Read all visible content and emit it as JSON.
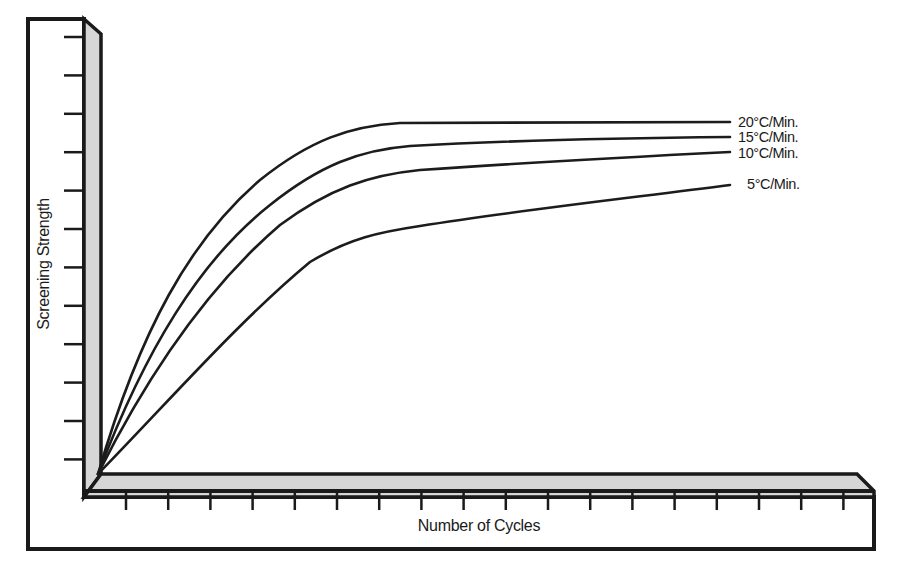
{
  "figure": {
    "ylabel": "Screening Strength",
    "xlabel": "Number of Cycles"
  },
  "legend": {
    "s20": "20°C/Min.",
    "s15": "15°C/Min.",
    "s10": "10°C/Min.",
    "s5": "5°C/Min."
  },
  "axes": {
    "y_tick_count": 12,
    "x_tick_count": 18,
    "y_tick_labels": [],
    "x_tick_labels": []
  },
  "chart_data": {
    "type": "line",
    "title": "",
    "xlabel": "Number of Cycles",
    "ylabel": "Screening Strength",
    "x_ticks_shown": 18,
    "y_ticks_shown": 12,
    "tick_labels_shown": false,
    "grid": false,
    "legend_position": "inline-right-end-of-lines",
    "units_note": "Qualitative curves; no numeric scale shown. Values below are relative (0 = origin, 1 = top of y-axis; x in fraction of x-axis length).",
    "x": [
      0.0,
      0.1,
      0.2,
      0.3,
      0.4,
      0.5,
      0.6,
      0.7,
      0.8,
      0.9
    ],
    "series": [
      {
        "name": "20°C/Min.",
        "values": [
          0.0,
          0.62,
          0.78,
          0.82,
          0.82,
          0.82,
          0.82,
          0.82,
          0.82,
          0.82
        ]
      },
      {
        "name": "15°C/Min.",
        "values": [
          0.0,
          0.56,
          0.73,
          0.76,
          0.77,
          0.78,
          0.78,
          0.78,
          0.79,
          0.79
        ]
      },
      {
        "name": "10°C/Min.",
        "values": [
          0.0,
          0.5,
          0.67,
          0.7,
          0.71,
          0.72,
          0.73,
          0.74,
          0.74,
          0.75
        ]
      },
      {
        "name": "5°C/Min.",
        "values": [
          0.0,
          0.32,
          0.5,
          0.56,
          0.58,
          0.6,
          0.62,
          0.64,
          0.66,
          0.67
        ]
      }
    ]
  }
}
